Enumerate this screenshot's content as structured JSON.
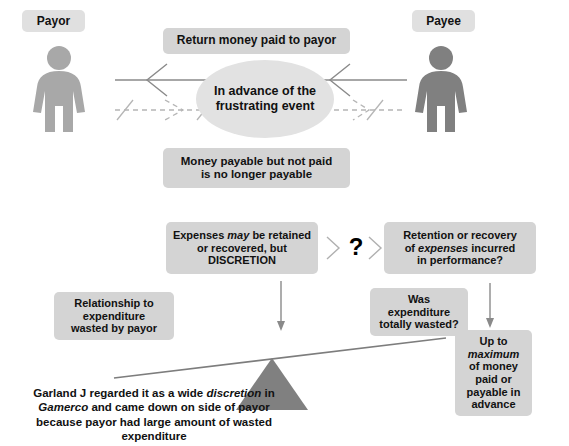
{
  "diagram": {
    "title_strip": "",
    "colors": {
      "payor_figure": "#a8a8a8",
      "payee_figure": "#808080",
      "box_grey": "#d4d4d4",
      "ellipse_grey": "#e2e2e2",
      "tag_grey": "#e0e0e0",
      "fulcrum_grey": "#808080",
      "line_grey": "#808080",
      "text_black": "#111111"
    },
    "actors": [
      {
        "id": "payor",
        "label": "Payor",
        "side": "left"
      },
      {
        "id": "payee",
        "label": "Payee",
        "side": "right"
      }
    ],
    "top_section": {
      "return_box": "Return money paid to payor",
      "ellipse_line1": "In advance of the",
      "ellipse_line2": "frustrating event",
      "not_payable_line1": "Money payable but not paid",
      "not_payable_line2": "is no longer payable"
    },
    "flow_section": {
      "discretion_box": {
        "line1_pre": "Expenses ",
        "line1_em": "may",
        "line1_post": " be retained",
        "line2": "or recovered, but",
        "line3": "DISCRETION"
      },
      "question_mark": "?",
      "retention_box": {
        "line1": "Retention or recovery",
        "line2_pre": "of ",
        "line2_em": "expenses",
        "line2_post": " incurred",
        "line3": "in performance?"
      },
      "wasted_box": {
        "line1": "Was",
        "line2": "expenditure",
        "line3": "totally wasted?"
      },
      "relationship_box": {
        "line1": "Relationship to",
        "line2": "expenditure",
        "line3": "wasted by payor"
      },
      "maximum_box": {
        "line1": "Up to",
        "line2_em": "maximum",
        "line3": "of money",
        "line4": "paid or",
        "line5": "payable in",
        "line6": "advance"
      }
    },
    "caption": {
      "line1_pre": "Garland J regarded it as a wide ",
      "line1_em": "discretion",
      "line1_post": " in",
      "line2_em": "Gamerco",
      "line2_post": " and came down on side of payor",
      "line3": "because payor had large amount of wasted",
      "line4": "expenditure"
    }
  }
}
